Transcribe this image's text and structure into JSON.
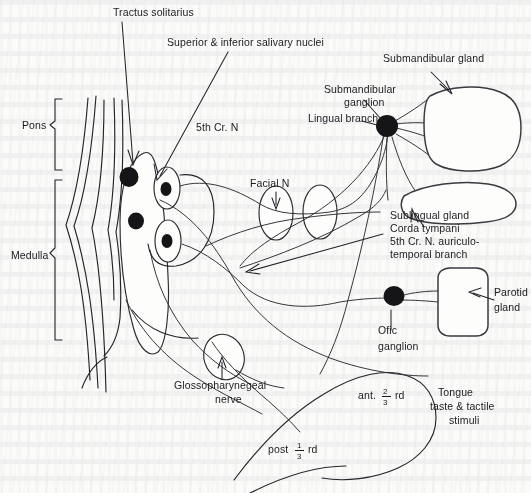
{
  "figure": {
    "background_color": "#fbfbfa",
    "ink_color": "#24242a"
  },
  "labels": {
    "tractus_solitarius": "Tractus solitarius",
    "salivary_nuclei": "Superior & inferior salivary nuclei",
    "fifth_cranial_nerve": "5th Cr. N",
    "pons": "Pons",
    "medulla": "Medulla",
    "facial_nerve": "Facial N",
    "submandibular_gland": "Submandibular gland",
    "submandibular_ganglion_line1": "Submandibular",
    "submandibular_ganglion_line2": "ganglion",
    "lingual_branch": "Lingual branch",
    "sublingual_gland": "Sublingual gland",
    "corda_tympani": "Corda tympani",
    "auriculotemporal_line1": "5th Cr. N. auriculo-",
    "auriculotemporal_line2": "temporal branch",
    "parotid_line1": "Parotid",
    "parotid_line2": "gland",
    "otic_ganglion_line1": "Ofic",
    "otic_ganglion_line2": "ganglion",
    "glossopharyngeal_line1": "Glossopharynegeal",
    "glossopharyngeal_line2": "nerve",
    "ant_two_thirds_prefix": "ant.",
    "ant_two_thirds_numerator": "2",
    "ant_two_thirds_denominator": "3",
    "ant_two_thirds_suffix": "rd",
    "post_one_third_prefix": "post",
    "post_one_third_numerator": "1",
    "post_one_third_denominator": "3",
    "post_one_third_suffix": "rd",
    "tongue_line1": "Tongue",
    "tongue_line2": "taste & tactile",
    "tongue_line3": "stimuli"
  }
}
